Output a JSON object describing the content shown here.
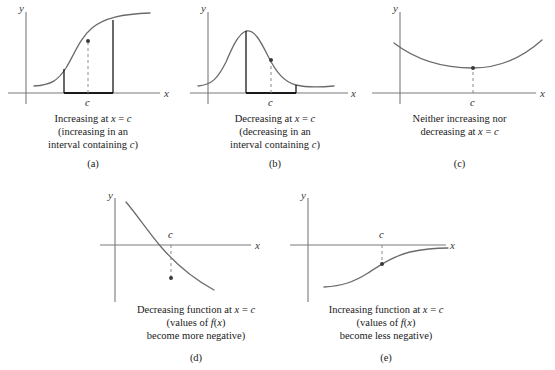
{
  "figure": {
    "axis_x_label": "x",
    "axis_y_label": "y",
    "tick_label_c": "c",
    "curve_color": "#6b6b6b",
    "axis_color": "#7a7a7a",
    "interval_color": "#1a1a1a",
    "dash_color": "#8a8a8a",
    "point_color": "#3a3a3a"
  },
  "panels": [
    {
      "id": "a",
      "label": "(a)",
      "caption_lines": [
        "Increasing at x = c",
        "(increasing in an",
        "interval containing c)"
      ],
      "description": "increasing S-shaped curve with highlighted interval containing c",
      "curve_type": "logistic-increasing",
      "point_at_c": true,
      "interval_marked": true
    },
    {
      "id": "b",
      "label": "(b)",
      "caption_lines": [
        "Decreasing at x = c",
        "(decreasing in an",
        "interval containing c)"
      ],
      "description": "bell-shaped curve with decreasing interval containing c highlighted",
      "curve_type": "bell",
      "point_at_c": true,
      "interval_marked": true
    },
    {
      "id": "c",
      "label": "(c)",
      "caption_lines": [
        "Neither increasing nor",
        "decreasing at x = c"
      ],
      "description": "upward parabola with vertex at c",
      "curve_type": "parabola-vertex",
      "point_at_c": true,
      "interval_marked": false
    },
    {
      "id": "d",
      "label": "(d)",
      "caption_lines": [
        "Decreasing function at x = c",
        "(values of f(x)",
        "become more negative)"
      ],
      "description": "decreasing exponential-like curve crossing the x-axis, point below axis at c",
      "curve_type": "decreasing-through-axis",
      "point_at_c": true,
      "interval_marked": false
    },
    {
      "id": "e",
      "label": "(e)",
      "caption_lines": [
        "Increasing function at x = c",
        "(values of f(x)",
        "become less negative)"
      ],
      "description": "increasing curve below the x-axis approaching it asymptotically, point below axis at c",
      "curve_type": "increasing-below-axis",
      "point_at_c": true,
      "interval_marked": false
    }
  ]
}
